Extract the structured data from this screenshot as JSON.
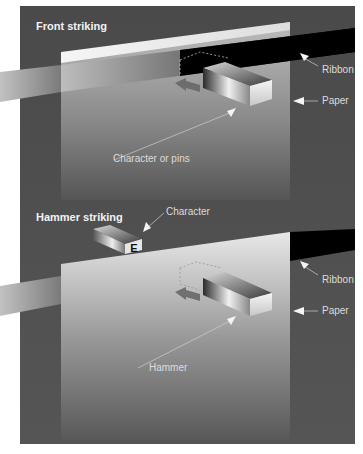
{
  "figure": {
    "background_color": "#505050",
    "paper_color": "#e8e8e8",
    "ribbon_color": "#000000"
  },
  "front_striking": {
    "title": "Front striking",
    "labels": {
      "ribbon": "Ribbon",
      "paper": "Paper",
      "character_or_pins": "Character or pins"
    }
  },
  "hammer_striking": {
    "title": "Hammer striking",
    "labels": {
      "character": "Character",
      "ribbon": "Ribbon",
      "paper": "Paper",
      "hammer": "Hammer"
    },
    "character_glyph": "E"
  }
}
